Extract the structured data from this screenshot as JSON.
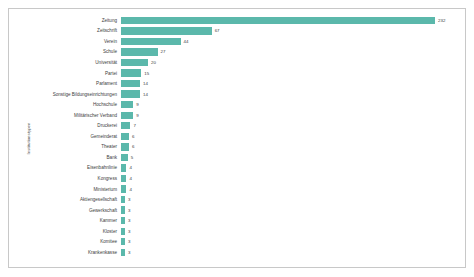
{
  "chart_data": {
    "type": "bar",
    "orientation": "horizontal",
    "title": "",
    "xlabel": "",
    "ylabel": "Institutionstypen",
    "grid": false,
    "legend": null,
    "xlim": [
      0,
      232
    ],
    "bar_color": "#5bb8ab",
    "categories": [
      "Zeitung",
      "Zeitschrift",
      "Verein",
      "Schule",
      "Universität",
      "Partei",
      "Parlament",
      "Sonstige Bildungseinrichtungen",
      "Hochschule",
      "Militärischer Verband",
      "Druckerei",
      "Gemeinderat",
      "Theater",
      "Bank",
      "Eisenbahnlinie",
      "Kongress",
      "Ministerium",
      "Aktiengesellschaft",
      "Gewerkschaft",
      "Kammer",
      "Kloster",
      "Komitee",
      "Krankenkasse"
    ],
    "values": [
      232,
      67,
      44,
      27,
      20,
      15,
      14,
      14,
      9,
      9,
      7,
      6,
      6,
      5,
      4,
      4,
      4,
      3,
      3,
      3,
      3,
      3,
      3
    ]
  },
  "panel": {
    "background": "#ffffff",
    "border_color": "#c8c8c8"
  }
}
